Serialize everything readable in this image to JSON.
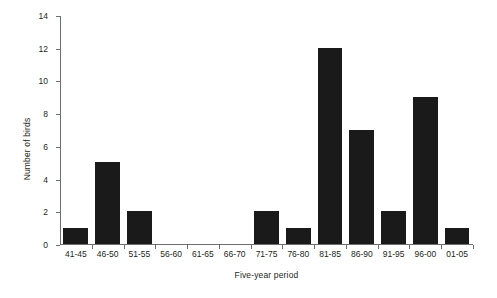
{
  "chart_data": {
    "type": "bar",
    "title": "",
    "subtitle": "",
    "xlabel": "Five-year period",
    "ylabel": "Number of birds",
    "categories": [
      "41-45",
      "46-50",
      "51-55",
      "56-60",
      "61-65",
      "66-70",
      "71-75",
      "76-80",
      "81-85",
      "86-90",
      "91-95",
      "96-00",
      "01-05"
    ],
    "values": [
      1,
      5,
      2,
      0,
      0,
      0,
      2,
      1,
      12,
      7,
      2,
      9,
      1
    ],
    "ylim": [
      0,
      14
    ],
    "yticks": [
      0,
      2,
      4,
      6,
      8,
      10,
      12,
      14
    ],
    "ytick_labels": [
      "0",
      "2",
      "4",
      "6",
      "8",
      "10",
      "12",
      "14"
    ],
    "grid": false,
    "legend": null,
    "bar_color": "#1a1a1a",
    "axis_color": "#6d6e71",
    "text_color": "#231f20",
    "background": "#ffffff"
  }
}
